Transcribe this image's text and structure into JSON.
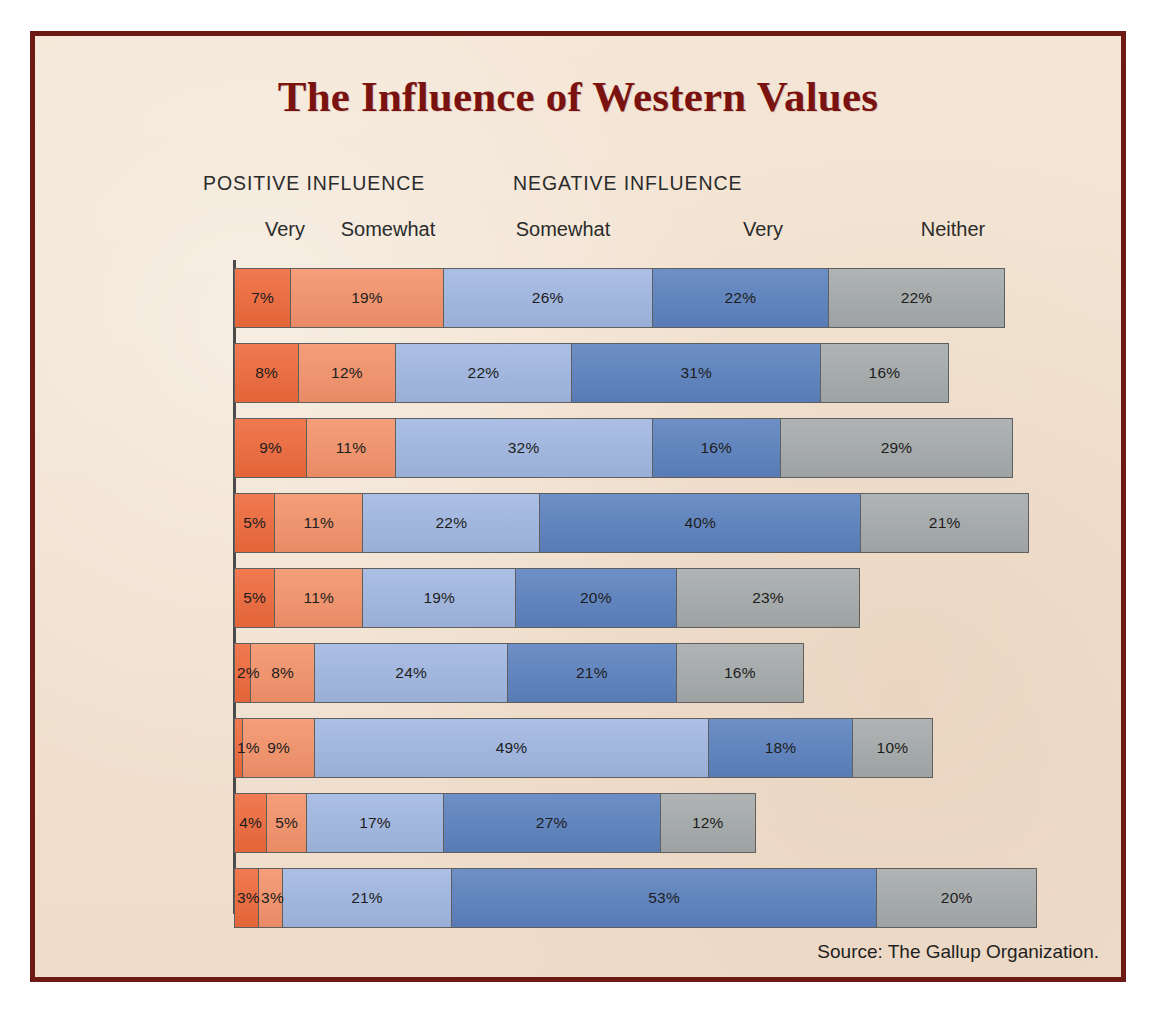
{
  "title": "The Influence of Western Values",
  "source_note": "Source: The Gallup Organization.",
  "group_headers": [
    {
      "label": "POSITIVE INFLUENCE"
    },
    {
      "label": "NEGATIVE INFLUENCE"
    }
  ],
  "column_headers": [
    {
      "label": "Very",
      "x": 250
    },
    {
      "label": "Somewhat",
      "x": 353
    },
    {
      "label": "Somewhat",
      "x": 528
    },
    {
      "label": "Very",
      "x": 728
    },
    {
      "label": "Neither",
      "x": 918
    }
  ],
  "colors": {
    "frame": "#6d1a15",
    "paper": "#f2e2d1",
    "title": "#7a120f",
    "very_positive": "#ef6a3c",
    "somewhat_positive": "#f4936b",
    "somewhat_negative": "#a2b8e2",
    "very_negative": "#5d82c0",
    "neither": "#a6abab"
  },
  "chart_data": {
    "type": "bar",
    "title": "The Influence of Western Values",
    "xlabel": "",
    "ylabel": "",
    "orientation": "horizontal",
    "stacked": true,
    "xlim": [
      0,
      100
    ],
    "grid": false,
    "legend": "top",
    "units": "percent",
    "categories": [
      "Kuwait",
      "Saudi Arabia",
      "Indonesia",
      "Lebanon",
      "Iran",
      "Turkey",
      "Morocco",
      "Pakistan",
      "Jordan"
    ],
    "series": [
      {
        "name": "Very positive",
        "group": "POSITIVE INFLUENCE",
        "color": "#ef6a3c",
        "values": [
          7,
          8,
          9,
          5,
          5,
          2,
          1,
          4,
          3
        ]
      },
      {
        "name": "Somewhat positive",
        "group": "POSITIVE INFLUENCE",
        "color": "#f4936b",
        "values": [
          19,
          12,
          11,
          11,
          11,
          8,
          9,
          5,
          3
        ]
      },
      {
        "name": "Somewhat negative",
        "group": "NEGATIVE INFLUENCE",
        "color": "#a2b8e2",
        "values": [
          26,
          22,
          32,
          22,
          19,
          24,
          49,
          17,
          21
        ]
      },
      {
        "name": "Very negative",
        "group": "NEGATIVE INFLUENCE",
        "color": "#5d82c0",
        "values": [
          22,
          31,
          16,
          40,
          20,
          21,
          18,
          27,
          53
        ]
      },
      {
        "name": "Neither",
        "group": "",
        "color": "#a6abab",
        "values": [
          22,
          16,
          29,
          21,
          23,
          16,
          10,
          12,
          20
        ]
      }
    ]
  },
  "rows": [
    {
      "country": "Kuwait",
      "y": 232,
      "segments": [
        {
          "key": "very_positive",
          "label": "7%",
          "value": 7
        },
        {
          "key": "somewhat_positive",
          "label": "19%",
          "value": 19
        },
        {
          "key": "somewhat_negative",
          "label": "26%",
          "value": 26
        },
        {
          "key": "very_negative",
          "label": "22%",
          "value": 22
        },
        {
          "key": "neither",
          "label": "22%",
          "value": 22
        }
      ]
    },
    {
      "country": "Saudi Arabia",
      "y": 307,
      "segments": [
        {
          "key": "very_positive",
          "label": "8%",
          "value": 8
        },
        {
          "key": "somewhat_positive",
          "label": "12%",
          "value": 12
        },
        {
          "key": "somewhat_negative",
          "label": "22%",
          "value": 22
        },
        {
          "key": "very_negative",
          "label": "31%",
          "value": 31
        },
        {
          "key": "neither",
          "label": "16%",
          "value": 16
        }
      ]
    },
    {
      "country": "Indonesia",
      "y": 382,
      "segments": [
        {
          "key": "very_positive",
          "label": "9%",
          "value": 9
        },
        {
          "key": "somewhat_positive",
          "label": "11%",
          "value": 11
        },
        {
          "key": "somewhat_negative",
          "label": "32%",
          "value": 32
        },
        {
          "key": "very_negative",
          "label": "16%",
          "value": 16
        },
        {
          "key": "neither",
          "label": "29%",
          "value": 29
        }
      ]
    },
    {
      "country": "Lebanon",
      "y": 457,
      "segments": [
        {
          "key": "very_positive",
          "label": "5%",
          "value": 5
        },
        {
          "key": "somewhat_positive",
          "label": "11%",
          "value": 11
        },
        {
          "key": "somewhat_negative",
          "label": "22%",
          "value": 22
        },
        {
          "key": "very_negative",
          "label": "40%",
          "value": 40
        },
        {
          "key": "neither",
          "label": "21%",
          "value": 21
        }
      ]
    },
    {
      "country": "Iran",
      "y": 532,
      "segments": [
        {
          "key": "very_positive",
          "label": "5%",
          "value": 5
        },
        {
          "key": "somewhat_positive",
          "label": "11%",
          "value": 11
        },
        {
          "key": "somewhat_negative",
          "label": "19%",
          "value": 19
        },
        {
          "key": "very_negative",
          "label": "20%",
          "value": 20
        },
        {
          "key": "neither",
          "label": "23%",
          "value": 23
        }
      ]
    },
    {
      "country": "Turkey",
      "y": 607,
      "segments": [
        {
          "key": "very_positive",
          "label": "2%",
          "value": 2,
          "narrow": true
        },
        {
          "key": "somewhat_positive",
          "label": "8%",
          "value": 8
        },
        {
          "key": "somewhat_negative",
          "label": "24%",
          "value": 24
        },
        {
          "key": "very_negative",
          "label": "21%",
          "value": 21
        },
        {
          "key": "neither",
          "label": "16%",
          "value": 16
        }
      ]
    },
    {
      "country": "Morocco",
      "y": 682,
      "segments": [
        {
          "key": "very_positive",
          "label": "1%",
          "value": 1,
          "narrow": true
        },
        {
          "key": "somewhat_positive",
          "label": "9%",
          "value": 9
        },
        {
          "key": "somewhat_negative",
          "label": "49%",
          "value": 49
        },
        {
          "key": "very_negative",
          "label": "18%",
          "value": 18
        },
        {
          "key": "neither",
          "label": "10%",
          "value": 10
        }
      ]
    },
    {
      "country": "Pakistan",
      "y": 757,
      "segments": [
        {
          "key": "very_positive",
          "label": "4%",
          "value": 4
        },
        {
          "key": "somewhat_positive",
          "label": "5%",
          "value": 5
        },
        {
          "key": "somewhat_negative",
          "label": "17%",
          "value": 17
        },
        {
          "key": "very_negative",
          "label": "27%",
          "value": 27
        },
        {
          "key": "neither",
          "label": "12%",
          "value": 12
        }
      ]
    },
    {
      "country": "Jordan",
      "y": 832,
      "segments": [
        {
          "key": "very_positive",
          "label": "3%",
          "value": 3,
          "narrow": true
        },
        {
          "key": "somewhat_positive",
          "label": "3%",
          "value": 3,
          "narrow": true
        },
        {
          "key": "somewhat_negative",
          "label": "21%",
          "value": 21
        },
        {
          "key": "very_negative",
          "label": "53%",
          "value": 53
        },
        {
          "key": "neither",
          "label": "20%",
          "value": 20
        }
      ]
    }
  ]
}
